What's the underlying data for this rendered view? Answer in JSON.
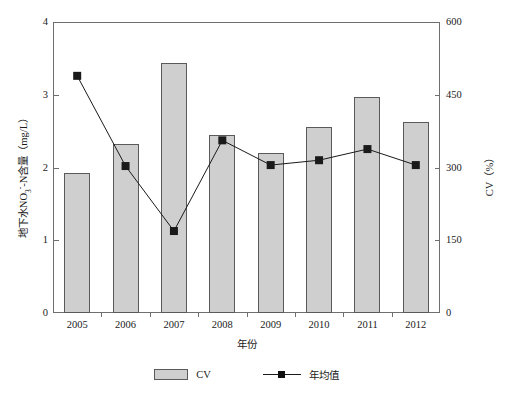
{
  "chart_data": {
    "type": "bar",
    "title": "",
    "subtitle": "",
    "xlabel": "年份",
    "ylabel": "地下水NO3--N含量（mg/L）",
    "ylabel_parts": {
      "prefix": "地下水NO",
      "sub": "3",
      "sup": "-",
      "suffix": "-N含量（mg/L）"
    },
    "y2label": "CV（%）",
    "categories": [
      "2005",
      "2006",
      "2007",
      "2008",
      "2009",
      "2010",
      "2011",
      "2012"
    ],
    "ylim": [
      0,
      4
    ],
    "y2lim": [
      0,
      600
    ],
    "yticks": [
      "0",
      "1",
      "2",
      "3",
      "4"
    ],
    "ytick_values": [
      0,
      1,
      2,
      3,
      4
    ],
    "y2ticks": [
      "0",
      "150",
      "300",
      "450",
      "600"
    ],
    "y2tick_values": [
      0,
      150,
      300,
      450,
      600
    ],
    "grid": false,
    "legend_position": "bottom-center",
    "series": [
      {
        "name": "CV",
        "type": "bar",
        "axis": "left",
        "color": "#cfcfcf",
        "edge_color": "#5a5a5a",
        "values": [
          1.92,
          2.33,
          3.44,
          2.45,
          2.2,
          2.56,
          2.97,
          2.63
        ]
      },
      {
        "name": "年均值",
        "type": "line",
        "axis": "right",
        "color": "#1a1a1a",
        "marker": "square",
        "values": [
          489,
          303,
          169,
          356,
          305,
          315,
          338,
          305
        ]
      }
    ]
  },
  "legend": {
    "items": [
      {
        "label": "CV",
        "marker": "bar-swatch"
      },
      {
        "label": "年均值",
        "marker": "line-square-swatch"
      }
    ]
  },
  "colors": {
    "bar_fill": "#cfcfcf",
    "bar_edge": "#5a5a5a",
    "line": "#1a1a1a",
    "marker": "#111111",
    "axis": "#6f6f6f",
    "background": "#ffffff",
    "text": "#1a1a1a"
  }
}
